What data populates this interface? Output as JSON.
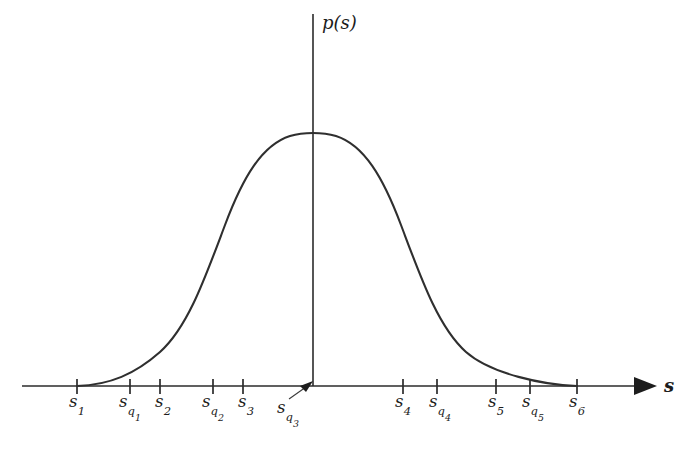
{
  "figure": {
    "background_color": "#ffffff",
    "ink_color": "#2b2b2b",
    "y_axis_label": "p(s)",
    "x_axis_label": "s"
  },
  "axes": {
    "x_axis": {
      "start_x": 22,
      "end_x": 655,
      "y": 386,
      "has_arrowhead": true,
      "arrow_direction": "right"
    },
    "y_axis": {
      "x": 313,
      "top_y": 14,
      "bottom_y": 386,
      "has_arrowhead": false
    }
  },
  "ticks": [
    {
      "label_html": "s<sub>1</sub>",
      "label_text": "s1",
      "x": 77,
      "label_x": 77,
      "label_y": 392
    },
    {
      "label_html": "s<sub>q<sub>1</sub></sub>",
      "label_text": "sq1",
      "x": 130,
      "label_x": 130,
      "label_y": 392
    },
    {
      "label_html": "s<sub>2</sub>",
      "label_text": "s2",
      "x": 160,
      "label_x": 163,
      "label_y": 392
    },
    {
      "label_html": "s<sub>q<sub>2</sub></sub>",
      "label_text": "sq2",
      "x": 213,
      "label_x": 213,
      "label_y": 392
    },
    {
      "label_html": "s<sub>3</sub>",
      "label_text": "s3",
      "x": 243,
      "label_x": 246,
      "label_y": 392
    },
    {
      "label_html": "s<sub>q<sub>3</sub></sub>",
      "label_text": "sq3",
      "x": 313,
      "label_x": 288,
      "label_y": 398,
      "is_origin": true,
      "has_leader_arrow": true
    },
    {
      "label_html": "s<sub>4</sub>",
      "label_text": "s4",
      "x": 403,
      "label_x": 403,
      "label_y": 392
    },
    {
      "label_html": "s<sub>q<sub>4</sub></sub>",
      "label_text": "sq4",
      "x": 437,
      "label_x": 440,
      "label_y": 392
    },
    {
      "label_html": "s<sub>5</sub>",
      "label_text": "s5",
      "x": 496,
      "label_x": 496,
      "label_y": 392
    },
    {
      "label_html": "s<sub>q<sub>5</sub></sub>",
      "label_text": "sq5",
      "x": 530,
      "label_x": 533,
      "label_y": 392
    },
    {
      "label_html": "s<sub>6</sub>",
      "label_text": "s6",
      "x": 577,
      "label_x": 577,
      "label_y": 392
    }
  ],
  "leader_arrow": {
    "from_x": 289,
    "from_y": 399,
    "to_x": 311,
    "to_y": 384,
    "points_to": "origin"
  },
  "chart_data": {
    "type": "line",
    "title": "",
    "xlabel": "s",
    "ylabel": "p(s)",
    "grid": false,
    "legend": null,
    "curve_shape": "gaussian-like bell",
    "peak": {
      "x_px": 313,
      "y_px": 133,
      "at_tick": "sq3"
    },
    "baseline_y_px": 386,
    "support": {
      "left_tick": "s1",
      "left_x_px": 77,
      "right_tick": "s6",
      "right_x_px": 577
    },
    "x_tick_labels": [
      "s1",
      "sq1",
      "s2",
      "sq2",
      "s3",
      "sq3",
      "s4",
      "sq4",
      "s5",
      "sq5",
      "s6"
    ],
    "x_tick_positions_px": [
      77,
      130,
      160,
      213,
      243,
      313,
      403,
      437,
      496,
      530,
      577
    ],
    "x": [
      77,
      100,
      125,
      150,
      175,
      200,
      225,
      250,
      275,
      300,
      313,
      330,
      355,
      380,
      405,
      430,
      455,
      480,
      505,
      530,
      555,
      577
    ],
    "y_normalized": [
      0.0,
      0.02,
      0.06,
      0.13,
      0.24,
      0.4,
      0.58,
      0.76,
      0.91,
      0.99,
      1.0,
      0.99,
      0.93,
      0.82,
      0.67,
      0.51,
      0.35,
      0.21,
      0.11,
      0.05,
      0.01,
      0.0
    ],
    "ylim": [
      0,
      1
    ],
    "y_axis_ticks": []
  }
}
